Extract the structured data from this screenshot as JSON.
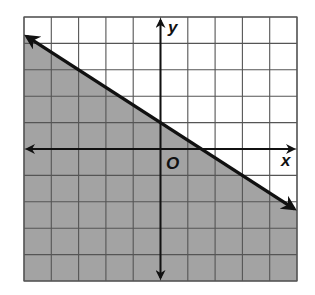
{
  "chart_data": {
    "type": "line",
    "title": "",
    "subtitle": "",
    "xlabel": "x",
    "ylabel": "y",
    "origin_label": "O",
    "xlim": [
      -5,
      5
    ],
    "ylim": [
      -5,
      5
    ],
    "grid": true,
    "grid_step": 1,
    "tick_labels": false,
    "series": [
      {
        "name": "boundary",
        "equation": "y = -2/3 x + 1",
        "slope": -0.6667,
        "intercept": 1,
        "style": "solid",
        "arrows": "both",
        "x": [
          -5,
          0,
          1.5,
          5
        ],
        "y": [
          4.333,
          1,
          0,
          -2.333
        ]
      }
    ],
    "shaded_region": {
      "side": "below",
      "inequality": "y <= -2/3 x + 1"
    },
    "legend": null
  },
  "colors": {
    "background": "#ffffff",
    "shade": "#a3a3a3",
    "grid": "#555555",
    "axis": "#111111",
    "boundary": "#111111"
  },
  "labels": {
    "x_axis": "x",
    "y_axis": "y",
    "origin": "O"
  }
}
